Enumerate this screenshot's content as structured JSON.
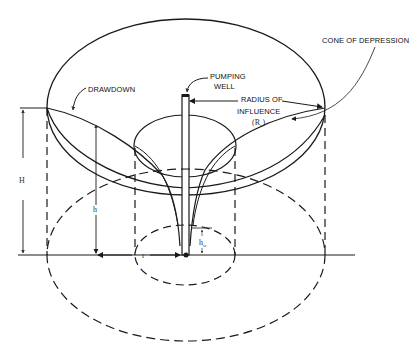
{
  "diagram": {
    "type": "cone-of-depression",
    "labels": {
      "cone_of_depression": "CONE OF DEPRESSION",
      "drawdown": "DRAWDOWN",
      "pumping_well_line1": "PUMPING",
      "pumping_well_line2": "WELL",
      "radius_line1": "RADIUS OF",
      "radius_line2": "INFLUENCE",
      "radius_symbol": "(R",
      "radius_symbol_sub": "o",
      "radius_symbol_close": ")"
    },
    "variables": {
      "H": "H",
      "h": "h",
      "hw": "h",
      "hw_sub": "w",
      "r": "r"
    },
    "colors": {
      "line": "#1a1a1a",
      "background": "#ffffff"
    }
  }
}
